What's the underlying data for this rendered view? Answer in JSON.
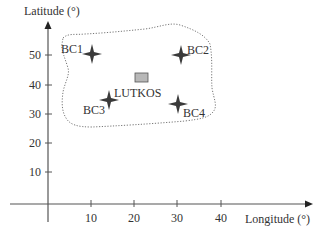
{
  "diagram": {
    "y_axis": {
      "title": "Latitude (°)",
      "ticks": [
        {
          "label": "50",
          "value": 50
        },
        {
          "label": "40",
          "value": 40
        },
        {
          "label": "30",
          "value": 30
        },
        {
          "label": "20",
          "value": 20
        },
        {
          "label": "10",
          "value": 10
        }
      ]
    },
    "x_axis": {
      "title": "Longitude (°)",
      "ticks": [
        {
          "label": "10",
          "value": 10
        },
        {
          "label": "20",
          "value": 20
        },
        {
          "label": "30",
          "value": 30
        },
        {
          "label": "40",
          "value": 40
        }
      ]
    },
    "points": [
      {
        "label": "BC1",
        "lon": 10,
        "lat": 50,
        "marker": "four-point-star"
      },
      {
        "label": "BC2",
        "lon": 30,
        "lat": 50,
        "marker": "four-point-star"
      },
      {
        "label": "BC3",
        "lon": 14,
        "lat": 35,
        "marker": "four-point-star"
      },
      {
        "label": "BC4",
        "lon": 30,
        "lat": 34,
        "marker": "four-point-star"
      }
    ],
    "site": {
      "label": "LUTKOS",
      "lon": 21,
      "lat": 43,
      "marker": "gray-rectangle"
    },
    "region": {
      "style": "dotted-outline",
      "description": "Domain enclosing BC1–BC4 and LUTKOS"
    },
    "colors": {
      "axis": "#555555",
      "star": "#3a3a3a",
      "site_fill": "#b8b8b8",
      "site_stroke": "#555555",
      "region": "#777777",
      "text": "#333333"
    }
  }
}
